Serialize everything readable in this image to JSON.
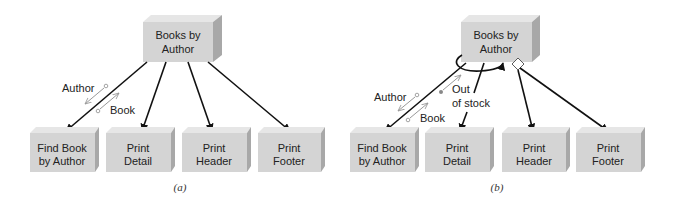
{
  "panels": [
    {
      "caption": "(a)",
      "top_module": {
        "line1": "Books by",
        "line2": "Author"
      },
      "modules": [
        {
          "line1": "Find Book",
          "line2": "by Author"
        },
        {
          "line1": "Print",
          "line2": "Detail"
        },
        {
          "line1": "Print",
          "line2": "Header"
        },
        {
          "line1": "Print",
          "line2": "Footer"
        }
      ],
      "couples": [
        {
          "label": "Author",
          "type": "data",
          "direction": "up"
        },
        {
          "label": "Book",
          "type": "data",
          "direction": "down"
        }
      ]
    },
    {
      "caption": "(b)",
      "top_module": {
        "line1": "Books by",
        "line2": "Author"
      },
      "modules": [
        {
          "line1": "Find Book",
          "line2": "by Author"
        },
        {
          "line1": "Print",
          "line2": "Detail"
        },
        {
          "line1": "Print",
          "line2": "Header"
        },
        {
          "line1": "Print",
          "line2": "Footer"
        }
      ],
      "couples": [
        {
          "label": "Author",
          "type": "data",
          "direction": "up"
        },
        {
          "label": "Book",
          "type": "data",
          "direction": "down"
        },
        {
          "label_line1": "Out",
          "label_line2": "of stock",
          "type": "control",
          "direction": "up"
        }
      ],
      "loop_symbol": "iteration-loop",
      "decision_symbol": "diamond"
    }
  ],
  "colors": {
    "box_front": "#d4d4d4",
    "box_top": "#e6e6e6",
    "box_side": "#a8a8a8",
    "edge": "#111111",
    "couple": "#999999"
  }
}
